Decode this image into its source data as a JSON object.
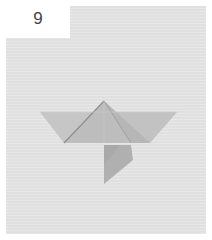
{
  "step": {
    "number": "9"
  },
  "illustration": {
    "subject": "origami-fold-step",
    "colors": {
      "background": "#e4e4e4",
      "paper_light": "#c4c4c4",
      "paper_mid": "#b5b5b5",
      "paper_dark": "#a8a8a8",
      "crease": "#8a8a8a"
    }
  }
}
